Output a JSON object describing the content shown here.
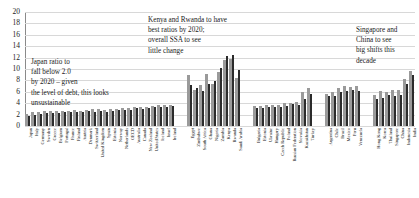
{
  "chart_data": {
    "type": "bar",
    "title": "",
    "subtitle": "",
    "xlabel": "",
    "ylabel": "",
    "ylim": [
      0,
      20
    ],
    "ytick_step": 2,
    "yticks": [
      0,
      2,
      4,
      6,
      8,
      10,
      12,
      14,
      16,
      18,
      20
    ],
    "grid": true,
    "grid_axis": "y",
    "legend": false,
    "legend_position": "none",
    "orientation": "vertical",
    "group_gap_categories": [
      "gap-1",
      "gap-2",
      "gap-3"
    ],
    "categories": [
      "Japan",
      "Italy",
      "Germany",
      "Sweden",
      "Greece",
      "Belgium",
      "Portugal",
      "France",
      "Finland",
      "Austria",
      "Denmark",
      "Switzerland",
      "United Kingdom",
      "Spain",
      "Estonia",
      "Norway",
      "Netherlands",
      "OECD",
      "Australia",
      "Canada",
      "New Zealand",
      "United States",
      "Iceland",
      "Israel",
      "Ireland",
      "",
      "",
      "Egypt",
      "Zimbabwe",
      "South Africa",
      "Ghana",
      "Nigeria",
      "Zambia",
      "Kenya",
      "Rwanda",
      "Saudi Arabia",
      "",
      "",
      "Bulgaria",
      "Estonia",
      "Ukraine",
      "Hungary",
      "Czech Republic",
      "Poland",
      "Russian Federation",
      "Slovakia",
      "Kazakhstan",
      "Turkey",
      "",
      "",
      "Argentina",
      "Chile",
      "Brazil",
      "Mexico",
      "Peru",
      "Venezuela",
      "",
      "",
      "Hong Kong",
      "Korea",
      "Thailand",
      "Singapore",
      "China",
      "Indonesia",
      "India"
    ],
    "series": [
      {
        "name": "Current",
        "color": "#9a9a9a",
        "values": [
          2.1,
          2.4,
          2.5,
          2.6,
          2.6,
          2.6,
          2.7,
          2.7,
          2.8,
          2.7,
          2.8,
          2.9,
          2.9,
          2.8,
          3.0,
          3.0,
          3.1,
          3.1,
          3.4,
          3.4,
          3.4,
          3.5,
          3.6,
          3.6,
          3.7,
          null,
          null,
          9.0,
          6.4,
          7.2,
          9.1,
          7.4,
          9.5,
          11.5,
          11.7,
          8.5,
          null,
          null,
          3.5,
          3.5,
          3.6,
          3.6,
          3.6,
          4.0,
          4.0,
          4.3,
          5.9,
          6.6,
          null,
          null,
          5.6,
          5.9,
          6.7,
          7.0,
          6.9,
          7.1,
          null,
          null,
          5.5,
          6.1,
          6.0,
          6.3,
          6.4,
          8.3,
          9.7
        ]
      },
      {
        "name": "Projected 2020",
        "color": "#2b2b2b",
        "values": [
          1.8,
          2.0,
          2.1,
          2.3,
          2.2,
          2.3,
          2.4,
          2.5,
          2.4,
          2.4,
          2.6,
          2.5,
          2.7,
          2.4,
          2.7,
          2.8,
          2.8,
          2.8,
          3.1,
          3.0,
          3.1,
          3.3,
          3.4,
          3.3,
          3.5,
          null,
          null,
          7.2,
          6.7,
          6.2,
          7.3,
          7.9,
          10.1,
          12.3,
          12.4,
          9.8,
          null,
          null,
          3.2,
          3.2,
          3.3,
          3.3,
          3.3,
          3.5,
          3.8,
          3.7,
          4.8,
          5.7,
          null,
          null,
          5.3,
          5.3,
          6.0,
          6.1,
          6.3,
          6.2,
          null,
          null,
          4.7,
          4.9,
          5.4,
          5.2,
          5.5,
          7.3,
          8.9
        ]
      }
    ],
    "annotations": [
      {
        "id": "annot-0",
        "text": "Japan ratio to\nfall below 2.0\nby 2020 – given\nthe level of debt, this looks\nunsustainable"
      },
      {
        "id": "annot-1",
        "text": "Kenya and Rwanda to have\nbest ratios by 2020;\noverall SSA to see\nlittle change"
      },
      {
        "id": "annot-2",
        "text": "Singapore and\nChina to see\nbig shifts this\ndecade"
      }
    ],
    "colors": {
      "series_light": "#9a9a9a",
      "series_dark": "#2b2b2b",
      "grid": "#d8d8d8",
      "axis": "#8a8a8a",
      "text": "#1a1a1a",
      "background": "#ffffff"
    }
  }
}
